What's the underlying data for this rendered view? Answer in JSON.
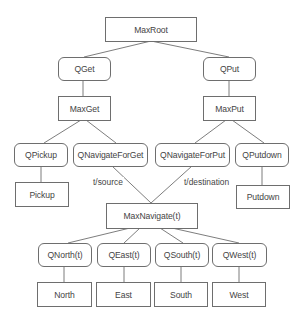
{
  "diagram": {
    "nodes": {
      "maxroot": "MaxRoot",
      "qget": "QGet",
      "qput": "QPut",
      "maxget": "MaxGet",
      "maxput": "MaxPut",
      "qpickup": "QPickup",
      "qnavigateforget": "QNavigateForGet",
      "qnavigateforput": "QNavigateForPut",
      "qputdown": "QPutdown",
      "pickup": "Pickup",
      "putdown": "Putdown",
      "maxnavigate": "MaxNavigate(t)",
      "qnorth": "QNorth(t)",
      "qeast": "QEast(t)",
      "qsouth": "QSouth(t)",
      "qwest": "QWest(t)",
      "north": "North",
      "east": "East",
      "south": "South",
      "west": "West"
    },
    "edge_labels": {
      "source": "t/source",
      "destination": "t/destination"
    },
    "edges": [
      [
        "MaxRoot",
        "QGet"
      ],
      [
        "MaxRoot",
        "QPut"
      ],
      [
        "QGet",
        "MaxGet"
      ],
      [
        "QPut",
        "MaxPut"
      ],
      [
        "MaxGet",
        "QPickup"
      ],
      [
        "MaxGet",
        "QNavigateForGet"
      ],
      [
        "MaxPut",
        "QNavigateForPut"
      ],
      [
        "MaxPut",
        "QPutdown"
      ],
      [
        "QPickup",
        "Pickup"
      ],
      [
        "QPutdown",
        "Putdown"
      ],
      [
        "QNavigateForGet",
        "MaxNavigate(t)",
        "t/source"
      ],
      [
        "QNavigateForPut",
        "MaxNavigate(t)",
        "t/destination"
      ],
      [
        "MaxNavigate(t)",
        "QNorth(t)"
      ],
      [
        "MaxNavigate(t)",
        "QEast(t)"
      ],
      [
        "MaxNavigate(t)",
        "QSouth(t)"
      ],
      [
        "MaxNavigate(t)",
        "QWest(t)"
      ],
      [
        "QNorth(t)",
        "North"
      ],
      [
        "QEast(t)",
        "East"
      ],
      [
        "QSouth(t)",
        "South"
      ],
      [
        "QWest(t)",
        "West"
      ]
    ]
  }
}
